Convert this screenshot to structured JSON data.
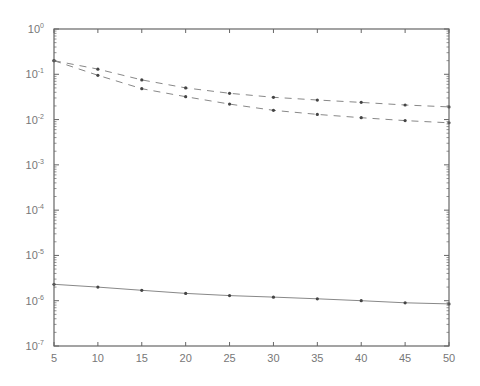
{
  "chart_data": {
    "type": "line",
    "title": "",
    "xlabel": "",
    "ylabel": "",
    "x": [
      5,
      10,
      15,
      20,
      25,
      30,
      35,
      40,
      45,
      50
    ],
    "xlim": [
      5,
      50
    ],
    "ylim": [
      1e-07,
      1
    ],
    "yscale": "log",
    "grid": false,
    "legend": null,
    "x_ticks": [
      "5",
      "10",
      "15",
      "20",
      "25",
      "30",
      "35",
      "40",
      "45",
      "50"
    ],
    "y_ticks": [
      "10^0",
      "10^-1",
      "10^-2",
      "10^-3",
      "10^-4",
      "10^-5",
      "10^-6",
      "10^-7"
    ],
    "series": [
      {
        "name": "upper dashed",
        "style": "dashed",
        "values": [
          0.2,
          0.13,
          0.075,
          0.05,
          0.038,
          0.031,
          0.027,
          0.024,
          0.021,
          0.019
        ]
      },
      {
        "name": "middle dashed",
        "style": "dashed",
        "values": [
          0.2,
          0.095,
          0.048,
          0.032,
          0.022,
          0.016,
          0.013,
          0.011,
          0.0095,
          0.0085
        ]
      },
      {
        "name": "bottom solid",
        "style": "solid",
        "values": [
          2.3e-06,
          2e-06,
          1.7e-06,
          1.45e-06,
          1.3e-06,
          1.2e-06,
          1.1e-06,
          1e-06,
          9e-07,
          8.5e-07
        ]
      }
    ]
  },
  "axes": {
    "x_labels": [
      "5",
      "10",
      "15",
      "20",
      "25",
      "30",
      "35",
      "40",
      "45",
      "50"
    ],
    "y_labels": [
      {
        "base": "10",
        "exp": "0"
      },
      {
        "base": "10",
        "exp": "-1"
      },
      {
        "base": "10",
        "exp": "-2"
      },
      {
        "base": "10",
        "exp": "-3"
      },
      {
        "base": "10",
        "exp": "-4"
      },
      {
        "base": "10",
        "exp": "-5"
      },
      {
        "base": "10",
        "exp": "-6"
      },
      {
        "base": "10",
        "exp": "-7"
      }
    ]
  },
  "colors": {
    "axis": "#666666",
    "line": "#888888",
    "marker": "#444444",
    "text": "#777777"
  }
}
